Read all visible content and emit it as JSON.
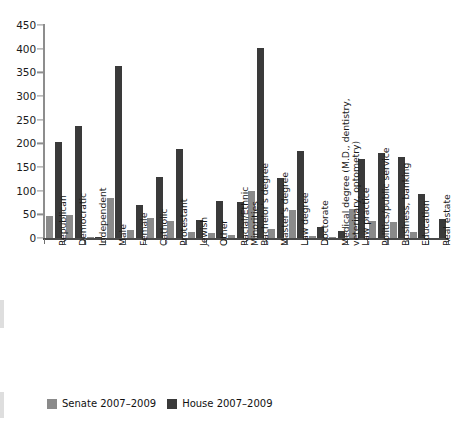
{
  "chart_data": {
    "type": "bar",
    "title": "",
    "subtitle": "",
    "xlabel": "",
    "ylabel": "",
    "ylim": [
      0,
      450
    ],
    "ytick_step": 50,
    "yticks": [
      0,
      50,
      100,
      150,
      200,
      250,
      300,
      350,
      400,
      450
    ],
    "grid": false,
    "legend_position": "bottom-left",
    "categories": [
      "Republican",
      "Democratic",
      "Independent",
      "Male",
      "Female",
      "Catholic",
      "Protestant",
      "Jewish",
      "Other",
      "Racial/Ethnic\nMinorities",
      "Bachelor's degree",
      "Master's degree",
      "Law degree",
      "Doctorate",
      "Medical degree (M.D., dentistry,\nveterinary, optometry)",
      "Law practice",
      "Politics/public service",
      "Business, banking",
      "Education",
      "Real estate"
    ],
    "series": [
      {
        "name": "Senate 2007–2009",
        "color": "#8a8a8a",
        "values": [
          47,
          48,
          3,
          84,
          16,
          43,
          37,
          13,
          11,
          6,
          100,
          18,
          59,
          5,
          3,
          62,
          36,
          34,
          12,
          0
        ]
      },
      {
        "name": "House 2007–2009",
        "color": "#3a3a3a",
        "values": [
          203,
          237,
          3,
          364,
          70,
          128,
          189,
          39,
          78,
          76,
          402,
          126,
          184,
          23,
          14,
          167,
          180,
          172,
          92,
          40
        ]
      }
    ]
  },
  "legend": {
    "items": [
      {
        "label": "Senate 2007–2009",
        "color": "#8a8a8a",
        "key": "senate"
      },
      {
        "label": "House 2007–2009",
        "color": "#3a3a3a",
        "key": "house"
      }
    ]
  }
}
